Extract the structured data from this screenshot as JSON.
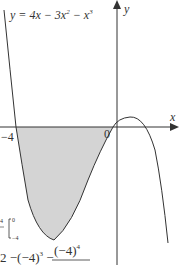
{
  "diagram": {
    "equation": "y = 4x − 3x² − x³",
    "equation_parts": {
      "lhs": "y = 4x − 3x",
      "exp2": "2",
      "mid": " − x",
      "exp3": "3"
    },
    "x_axis_label": "x",
    "y_axis_label": "y",
    "origin_label": "0",
    "x_intercept_label": "−4",
    "shaded_region": "Area between curve and x-axis for −4 ≤ x ≤ 0 (below axis)",
    "colors": {
      "curve": "#333333",
      "shade": "#d4d4d4",
      "axis": "#333333"
    },
    "working_fragment": {
      "limit_top": "0",
      "limit_bottom": "−4",
      "frac_top": "4",
      "expression_part1": "2 −(−4)",
      "exp_a": "3",
      "frac_numerator": "(−4)",
      "exp_b": "4"
    }
  }
}
